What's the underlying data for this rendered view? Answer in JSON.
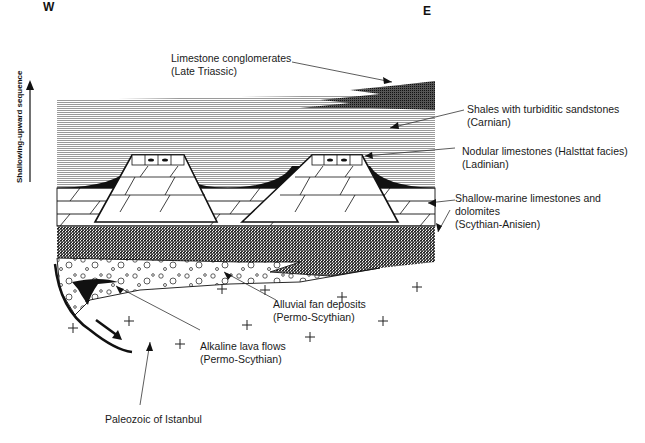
{
  "figure": {
    "orientation": {
      "west": "W",
      "east": "E"
    },
    "axis_label": "Shallowing-upward sequence",
    "units": [
      {
        "id": "limestone-conglomerates",
        "name": "Limestone conglomerates",
        "age": "(Late Triassic)"
      },
      {
        "id": "shales-turbiditic",
        "name": "Shales with turbiditic sandstones",
        "age": "(Carnian)"
      },
      {
        "id": "nodular-limestones",
        "name": "Nodular limestones (Halsttat facies)",
        "age": "(Ladinian)"
      },
      {
        "id": "shallow-marine",
        "name": "Shallow-marine limestones and",
        "name2": "dolomites",
        "age": "(Scythian-Anisien)"
      },
      {
        "id": "alluvial-fan",
        "name": "Alluvial fan deposits",
        "age": "(Permo-Scythian)"
      },
      {
        "id": "alkaline-lava",
        "name": "Alkaline lava flows",
        "age": "(Permo-Scythian)"
      },
      {
        "id": "paleozoic",
        "name": "Paleozoic of Istanbul"
      }
    ],
    "colors": {
      "ink": "#111111",
      "shale": "#bdbdbd",
      "dark_shale": "#6a6a6a",
      "conglomerate": "#3a3a3a",
      "paper": "#ffffff"
    }
  }
}
